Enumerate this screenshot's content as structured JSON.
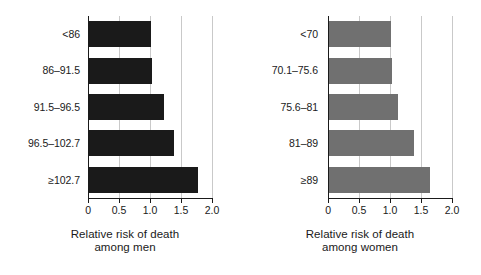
{
  "chart_data": [
    {
      "type": "bar",
      "orientation": "horizontal",
      "panel": "men",
      "title": "",
      "xlabel": "Relative risk of death among men",
      "xlabel_line1": "Relative risk of death",
      "xlabel_line2": "among men",
      "ylabel": "Waist quintiles",
      "categories": [
        "<86",
        "86–91.5",
        "91.5–96.5",
        "96.5–102.7",
        "≥102.7"
      ],
      "values": [
        1.0,
        1.03,
        1.22,
        1.38,
        1.78
      ],
      "xlim": [
        0,
        2.0
      ],
      "xticks": [
        0,
        0.5,
        1.0,
        1.5,
        2.0
      ],
      "xticklabels": [
        "0",
        "0.5",
        "1.0",
        "1.5",
        "2.0"
      ],
      "grid": "vertical",
      "legend": "none",
      "bar_color": "#1a1a1a"
    },
    {
      "type": "bar",
      "orientation": "horizontal",
      "panel": "women",
      "title": "",
      "xlabel": "Relative risk of death among women",
      "xlabel_line1": "Relative risk of death",
      "xlabel_line2": "among women",
      "ylabel": "",
      "categories": [
        "<70",
        "70.1–75.6",
        "75.6–81",
        "81–89",
        "≥89"
      ],
      "values": [
        1.0,
        1.02,
        1.12,
        1.39,
        1.64
      ],
      "xlim": [
        0,
        2.0
      ],
      "xticks": [
        0,
        0.5,
        1.0,
        1.5,
        2.0
      ],
      "xticklabels": [
        "0",
        "0.5",
        "1.0",
        "1.5",
        "2.0"
      ],
      "grid": "vertical",
      "legend": "none",
      "bar_color": "#707070"
    }
  ],
  "colors": {
    "men_bar": "#1a1a1a",
    "women_bar": "#707070",
    "gridline": "#c9c9c9",
    "axis": "#1a1a1a",
    "background": "#ffffff"
  }
}
